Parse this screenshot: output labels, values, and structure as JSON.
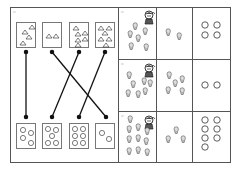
{
  "worksheet": {
    "left_panel": {
      "label": "▫",
      "top_cards": [
        {
          "shape": "triangle",
          "count": 4
        },
        {
          "shape": "triangle",
          "count": 2
        },
        {
          "shape": "triangle",
          "count": 5
        },
        {
          "shape": "triangle",
          "count": 6
        }
      ],
      "bottom_cards": [
        {
          "shape": "circle",
          "count": 4
        },
        {
          "shape": "circle",
          "count": 5
        },
        {
          "shape": "circle",
          "count": 6
        },
        {
          "shape": "circle",
          "count": 2
        }
      ],
      "connections": [
        [
          0,
          0
        ],
        [
          1,
          3
        ],
        [
          2,
          1
        ],
        [
          3,
          2
        ]
      ]
    },
    "right_panel": {
      "rows": [
        {
          "label": "▫",
          "icon": "ice-cream-icon",
          "left_count": 6,
          "middle_count": 2,
          "circle_count": 4
        },
        {
          "label": "▫",
          "icon": "ice-cream-icon",
          "left_count": 7,
          "middle_count": 5,
          "circle_count": 2
        },
        {
          "label": "▫",
          "icon": "ice-cream-icon",
          "left_count": 10,
          "middle_count": 3,
          "circle_count": 7
        }
      ]
    }
  }
}
